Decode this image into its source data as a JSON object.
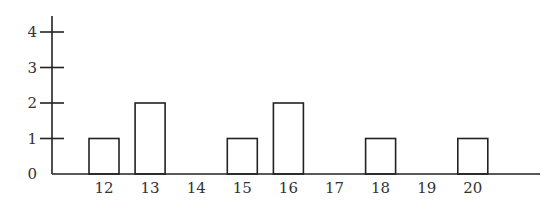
{
  "chart_data": {
    "type": "bar",
    "title": "",
    "xlabel": "",
    "ylabel": "",
    "categories": [
      "12",
      "13",
      "14",
      "15",
      "16",
      "17",
      "18",
      "19",
      "20"
    ],
    "values": [
      1,
      2,
      0,
      1,
      2,
      0,
      1,
      0,
      1
    ],
    "yticks": [
      "0",
      "1",
      "2",
      "3",
      "4"
    ],
    "ylim": [
      0,
      4
    ],
    "grid": false,
    "legend": null,
    "bar_fill": "#ffffff",
    "bar_stroke": "#222222"
  }
}
